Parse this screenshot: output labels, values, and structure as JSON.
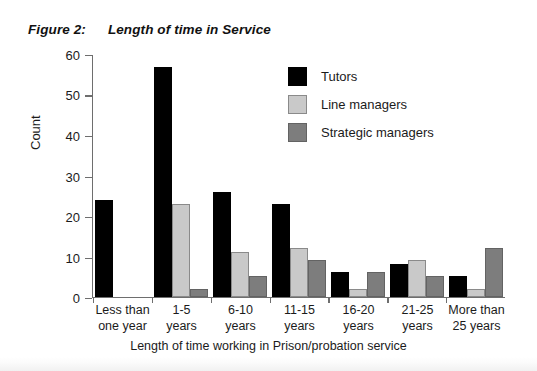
{
  "figure": {
    "label": "Figure 2:",
    "title": "Length of time in Service"
  },
  "colors": {
    "tutors": "#000000",
    "line_managers": "#c9c9c9",
    "strategic_managers": "#7d7d7d",
    "axis": "#6e6e6e",
    "text": "#1b1b1b",
    "background": "#ffffff"
  },
  "legend": {
    "position": "top-right",
    "entries": [
      {
        "label": "Tutors",
        "color": "#000000",
        "icon": "square-swatch-icon"
      },
      {
        "label": "Line managers",
        "color": "#c9c9c9",
        "icon": "square-swatch-icon"
      },
      {
        "label": "Strategic managers",
        "color": "#7d7d7d",
        "icon": "square-swatch-icon"
      }
    ]
  },
  "chart_data": {
    "type": "bar",
    "title": "Length of time in Service",
    "xlabel": "Length of time working in Prison/probation service",
    "ylabel": "Count",
    "ylim": [
      0,
      60
    ],
    "yticks": [
      0,
      10,
      20,
      30,
      40,
      50,
      60
    ],
    "grid": false,
    "legend_position": "top-right",
    "categories": [
      "Less than one year",
      "1-5 years",
      "6-10 years",
      "11-15 years",
      "16-20 years",
      "21-25 years",
      "More than 25 years"
    ],
    "category_lines": [
      [
        "Less than",
        "one year"
      ],
      [
        "1-5",
        "years"
      ],
      [
        "6-10",
        "years"
      ],
      [
        "11-15",
        "years"
      ],
      [
        "16-20",
        "years"
      ],
      [
        "21-25",
        "years"
      ],
      [
        "More than",
        "25 years"
      ]
    ],
    "series": [
      {
        "name": "Tutors",
        "color": "#000000",
        "values": [
          24,
          57,
          26,
          23,
          6,
          8,
          5
        ]
      },
      {
        "name": "Line managers",
        "color": "#c9c9c9",
        "values": [
          null,
          23,
          11,
          12,
          2,
          9,
          2
        ]
      },
      {
        "name": "Strategic managers",
        "color": "#7d7d7d",
        "values": [
          null,
          2,
          5,
          9,
          6,
          5,
          12
        ]
      }
    ]
  }
}
